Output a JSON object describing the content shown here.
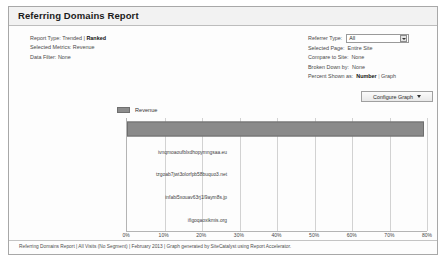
{
  "window": {
    "title": "Referring Domains Report"
  },
  "meta": [
    {
      "label": "Report Type:",
      "value_plain": "Trended | ",
      "value_bold": "Ranked"
    },
    {
      "label": "Selected Metrics:",
      "value_plain": "Revenue",
      "value_bold": ""
    },
    {
      "label": "Data Filter:",
      "value_plain": "None",
      "value_bold": ""
    }
  ],
  "settings": {
    "referrer_type": {
      "label": "Referrer Type:",
      "value": "All"
    },
    "selected_page": {
      "label": "Selected Page:",
      "value": "Entire Site"
    },
    "compare_to_site": {
      "label": "Compare to Site:",
      "value": "None"
    },
    "broken_down_by": {
      "label": "Broken Down by:",
      "value": "None"
    },
    "percent_shown_as": {
      "label": "Percent Shown as:",
      "bold_option": "Number",
      "separator": "|",
      "other_option": "Graph"
    }
  },
  "configure_button": {
    "label": "Configure Graph"
  },
  "legend": {
    "entries": [
      {
        "label": "Revenue",
        "color": "#8c8c8c"
      }
    ]
  },
  "footer": {
    "text": "Referring Domains Report | All Visits (No Segment) | February 2013 | Graph generated by SiteCatalyst using Report Accelerator."
  },
  "chart_data": {
    "type": "bar",
    "orientation": "horizontal",
    "title": "Referring Domains Report",
    "xlabel": "",
    "ylabel": "",
    "xlim": [
      0,
      80
    ],
    "xticks": [
      0,
      10,
      20,
      30,
      40,
      50,
      60,
      70,
      80
    ],
    "xtick_labels": [
      "0%",
      "10%",
      "20%",
      "30%",
      "40%",
      "50%",
      "60%",
      "70%",
      "80%"
    ],
    "grid": true,
    "legend_position": "top-left",
    "categories": [
      "fakedomain.com",
      "ivnqmoaoufblxdhopymngsaa.eu",
      "tzgoab7jwt3olorfpb58buquo3.net",
      "infabi5xouav63rj1l9aym8s.jp",
      "ifigoqaoxikmis.org"
    ],
    "series": [
      {
        "name": "Revenue",
        "color": "#8a8a8a",
        "values": [
          79.2,
          0,
          0,
          0,
          0
        ]
      }
    ]
  }
}
